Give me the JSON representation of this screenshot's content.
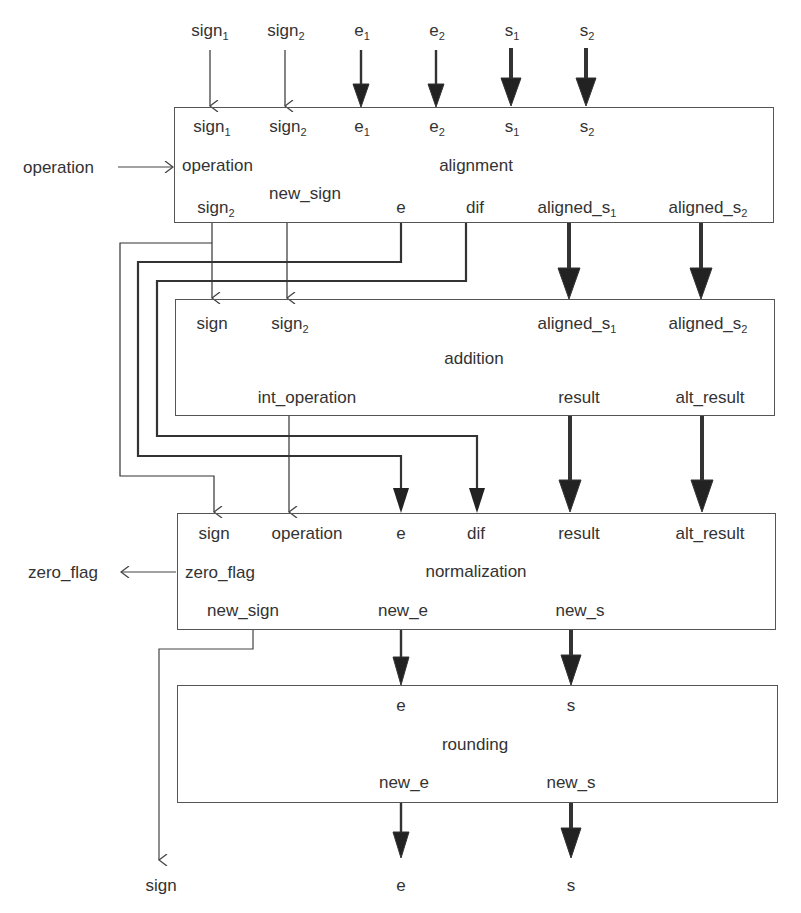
{
  "diagram": {
    "type": "floating-point adder pipeline block diagram",
    "top_inputs": [
      {
        "id": "sign1",
        "base": "sign",
        "sub": "1",
        "x": 210,
        "weight": "thin"
      },
      {
        "id": "sign2",
        "base": "sign",
        "sub": "2",
        "x": 285,
        "weight": "thin"
      },
      {
        "id": "e1",
        "base": "e",
        "sub": "1",
        "x": 361,
        "weight": "medium"
      },
      {
        "id": "e2",
        "base": "e",
        "sub": "2",
        "x": 436,
        "weight": "medium"
      },
      {
        "id": "s1",
        "base": "s",
        "sub": "1",
        "x": 511,
        "weight": "thick"
      },
      {
        "id": "s2",
        "base": "s",
        "sub": "2",
        "x": 586,
        "weight": "thick"
      }
    ],
    "side_input": {
      "label": "operation"
    },
    "side_output": {
      "label": "zero_flag"
    },
    "blocks": {
      "alignment": {
        "title": "alignment",
        "inputs": [
          {
            "base": "sign",
            "sub": "1"
          },
          {
            "base": "sign",
            "sub": "2"
          },
          {
            "base": "e",
            "sub": "1"
          },
          {
            "base": "e",
            "sub": "2"
          },
          {
            "base": "s",
            "sub": "1"
          },
          {
            "base": "s",
            "sub": "2"
          },
          {
            "base": "operation",
            "sub": ""
          }
        ],
        "outputs": [
          {
            "base": "sign",
            "sub": "2"
          },
          {
            "base": "new_sign",
            "sub": ""
          },
          {
            "base": "e",
            "sub": ""
          },
          {
            "base": "dif",
            "sub": ""
          },
          {
            "base": "aligned_s",
            "sub": "1"
          },
          {
            "base": "aligned_s",
            "sub": "2"
          }
        ]
      },
      "addition": {
        "title": "addition",
        "inputs": [
          {
            "base": "sign",
            "sub": ""
          },
          {
            "base": "sign",
            "sub": "2"
          },
          {
            "base": "aligned_s",
            "sub": "1"
          },
          {
            "base": "aligned_s",
            "sub": "2"
          }
        ],
        "outputs": [
          {
            "base": "int_operation",
            "sub": ""
          },
          {
            "base": "result",
            "sub": ""
          },
          {
            "base": "alt_result",
            "sub": ""
          }
        ]
      },
      "normalization": {
        "title": "normalization",
        "inputs": [
          {
            "base": "sign",
            "sub": ""
          },
          {
            "base": "operation",
            "sub": ""
          },
          {
            "base": "e",
            "sub": ""
          },
          {
            "base": "dif",
            "sub": ""
          },
          {
            "base": "result",
            "sub": ""
          },
          {
            "base": "alt_result",
            "sub": ""
          }
        ],
        "outputs": [
          {
            "base": "zero_flag",
            "sub": ""
          },
          {
            "base": "new_sign",
            "sub": ""
          },
          {
            "base": "new_e",
            "sub": ""
          },
          {
            "base": "new_s",
            "sub": ""
          }
        ]
      },
      "rounding": {
        "title": "rounding",
        "inputs": [
          {
            "base": "e",
            "sub": ""
          },
          {
            "base": "s",
            "sub": ""
          }
        ],
        "outputs": [
          {
            "base": "new_e",
            "sub": ""
          },
          {
            "base": "new_s",
            "sub": ""
          }
        ]
      }
    },
    "final_outputs": [
      {
        "label": "sign",
        "x": 163
      },
      {
        "label": "e",
        "x": 401
      },
      {
        "label": "s",
        "x": 571
      }
    ]
  }
}
